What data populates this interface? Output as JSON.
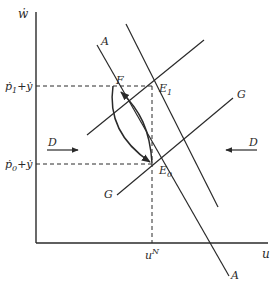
{
  "diagram": {
    "axes": {
      "y_label": "ẇ",
      "x_label": "u"
    },
    "levels": {
      "upper": {
        "label_p": "ṗ",
        "label_sub": "1",
        "label_rest": "+ẏ"
      },
      "lower": {
        "label_p": "ṗ",
        "label_sub": "0",
        "label_rest": "+ẏ"
      }
    },
    "natural_rate": {
      "label_main": "u",
      "label_sup": "N"
    },
    "curves": {
      "A_top": "A",
      "A_bottom": "A",
      "G_right": "G",
      "G_left": "G"
    },
    "points": {
      "F": "F",
      "E1_main": "E",
      "E1_sub": "1",
      "E0_main": "E",
      "E0_sub": "0"
    },
    "arrows": {
      "D_left": "D",
      "D_right": "D"
    },
    "colors": {
      "ink": "#2a2a2a"
    }
  }
}
